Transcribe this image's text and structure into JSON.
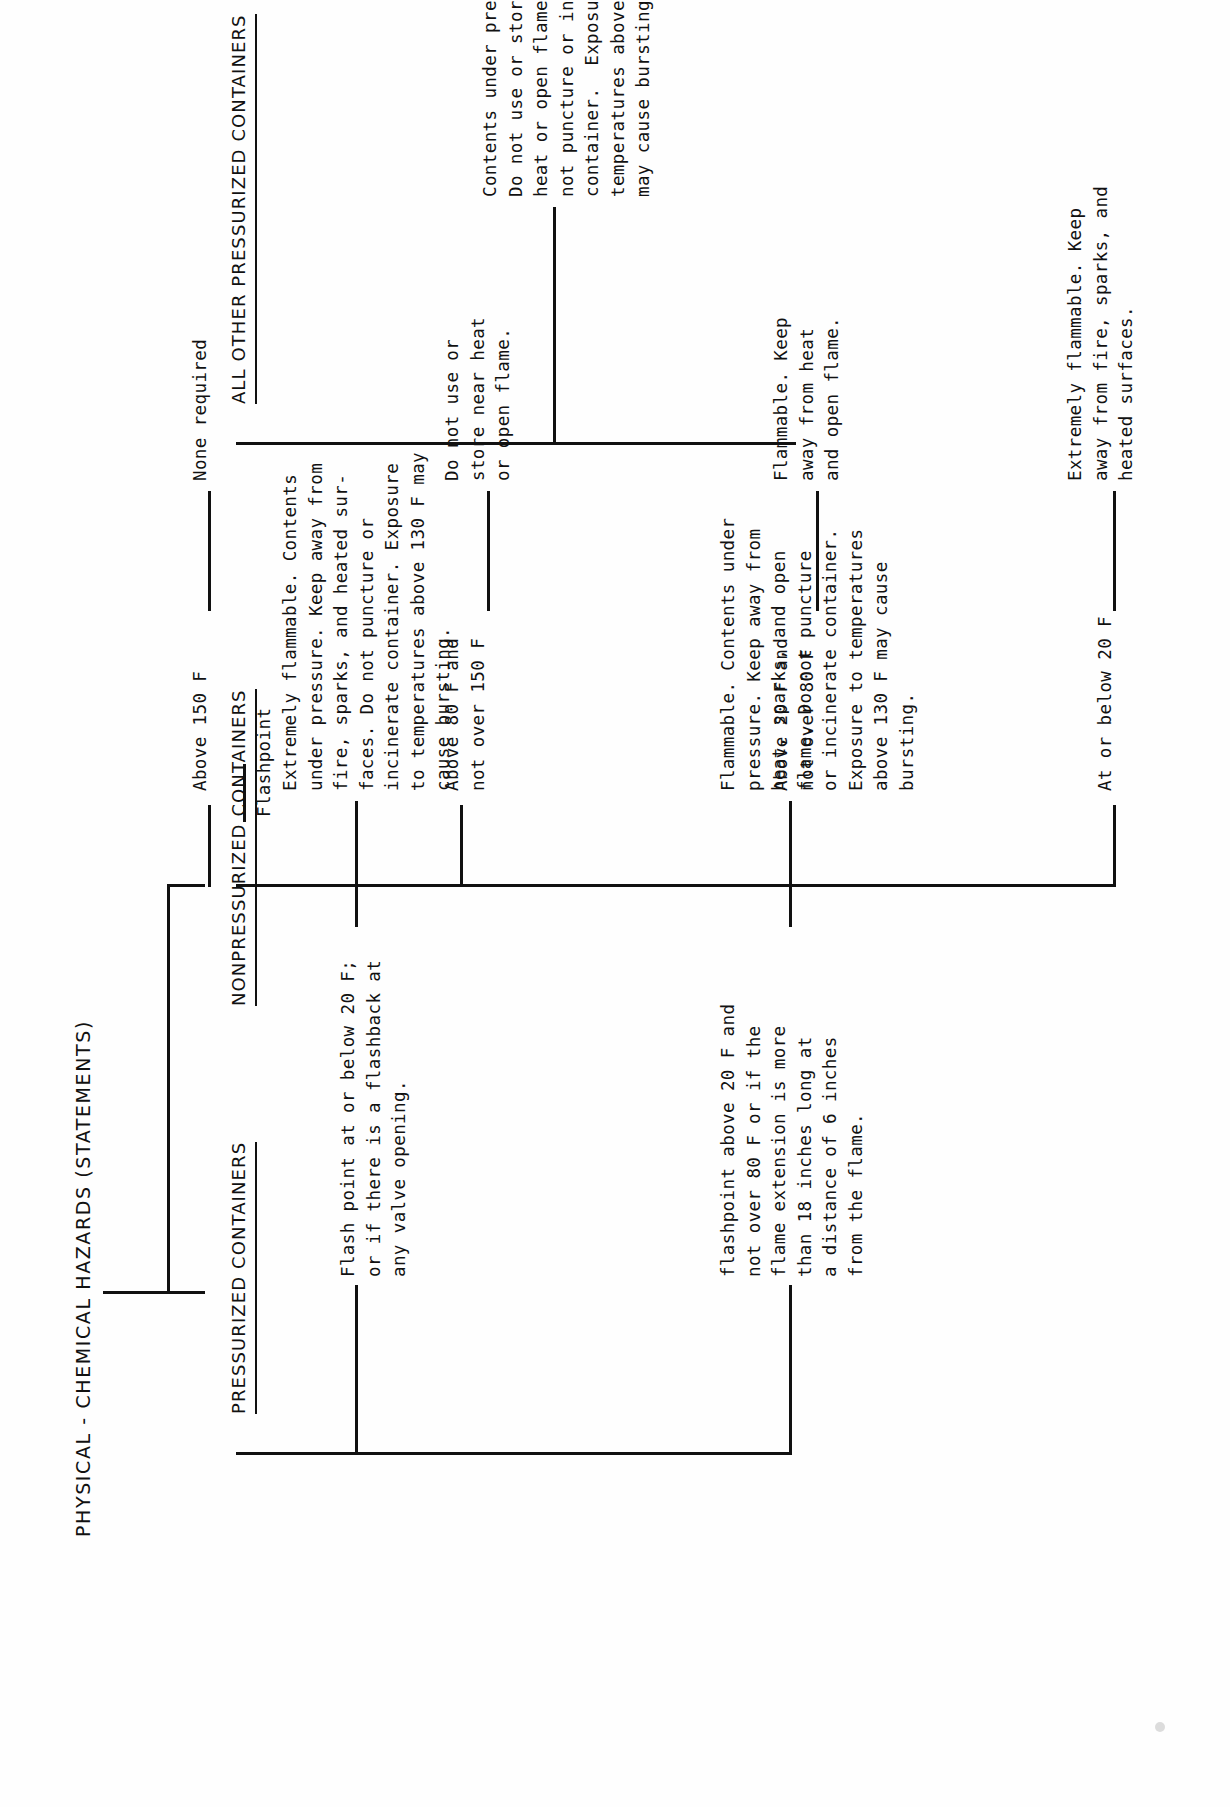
{
  "document": {
    "title": "PHYSICAL - CHEMICAL HAZARDS (STATEMENTS)",
    "orientation": "rotated-90-ccw",
    "ink_color": "#111111",
    "paper_color": "#fefefe"
  },
  "tree": {
    "root_label": "PHYSICAL - CHEMICAL HAZARDS (STATEMENTS)",
    "branches": {
      "pressurized": {
        "label": "PRESSURIZED CONTAINERS",
        "criteria": [
          {
            "id": "p-flash-low",
            "condition": "Flash point at or below 20 F;\nor if there is a flashback at\nany valve opening.",
            "statement": "Extremely flammable. Contents\nunder pressure. Keep away from\nfire, sparks, and heated sur-\nfaces. Do not puncture or\nincinerate container. Exposure\nto temperatures above 130 F may\ncause bursting."
          },
          {
            "id": "p-flash-mid",
            "condition": "flashpoint above 20 F and\nnot over 80 F or if the\nflame extension is more\nthan 18 inches long at\na distance of 6 inches\nfrom the flame.",
            "statement": "Flammable. Contents under\npressure. Keep away from\nheat, sparks, and open\nflame. Do not puncture\nor incinerate container.\nExposure to temperatures\nabove 130 F may cause\nbursting."
          }
        ]
      },
      "nonpressurized": {
        "label": "NONPRESSURIZED CONTAINERS",
        "sub_label": "Flashpoint",
        "criteria": [
          {
            "id": "n-at-or-below-20",
            "condition": "At or below 20 F",
            "statement": "Extremely flammable. Keep\naway from fire, sparks, and\nheated surfaces."
          },
          {
            "id": "n-20-to-80",
            "condition": "Above 20 F and\nnot over 80 F",
            "statement": "Flammable. Keep\naway from heat\nand open flame."
          },
          {
            "id": "n-80-to-150",
            "condition": "Above 80 F and\nnot over 150 F",
            "statement": "Do not use or\nstore near heat\nor open flame."
          },
          {
            "id": "n-above-150",
            "condition": "Above 150 F",
            "statement": "None required"
          }
        ]
      },
      "all_other_pressurized": {
        "label": "ALL OTHER PRESSURIZED CONTAINERS",
        "criteria": [
          {
            "id": "aop-1",
            "condition": "",
            "statement": "Contents under pressure.\nDo not use or store near\nheat or open flame.  Do\nnot puncture or incinerate\ncontainer.  Exposure to\ntemperatures above 130 F\nmay cause bursting."
          }
        ]
      }
    }
  }
}
